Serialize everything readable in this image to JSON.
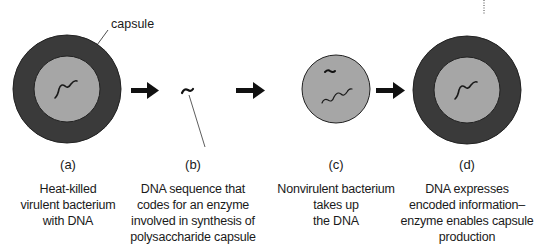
{
  "colors": {
    "capsule": "#3a3a3a",
    "cell": "#a6a6a6",
    "dna": "#1a1a1a",
    "arrow": "#111111"
  },
  "capsule_label": "capsule",
  "steps": [
    {
      "letter": "(a)",
      "lines": [
        "Heat-killed",
        "virulent bacterium",
        "with DNA"
      ]
    },
    {
      "letter": "(b)",
      "lines": [
        "DNA sequence that",
        "codes for an enzyme",
        "involved in synthesis of",
        "polysaccharide capsule"
      ]
    },
    {
      "letter": "(c)",
      "lines": [
        "Nonvirulent bacterium",
        "takes up",
        "the DNA"
      ]
    },
    {
      "letter": "(d)",
      "lines": [
        "DNA expresses",
        "encoded information–",
        "enzyme enables capsule",
        "production"
      ]
    }
  ]
}
